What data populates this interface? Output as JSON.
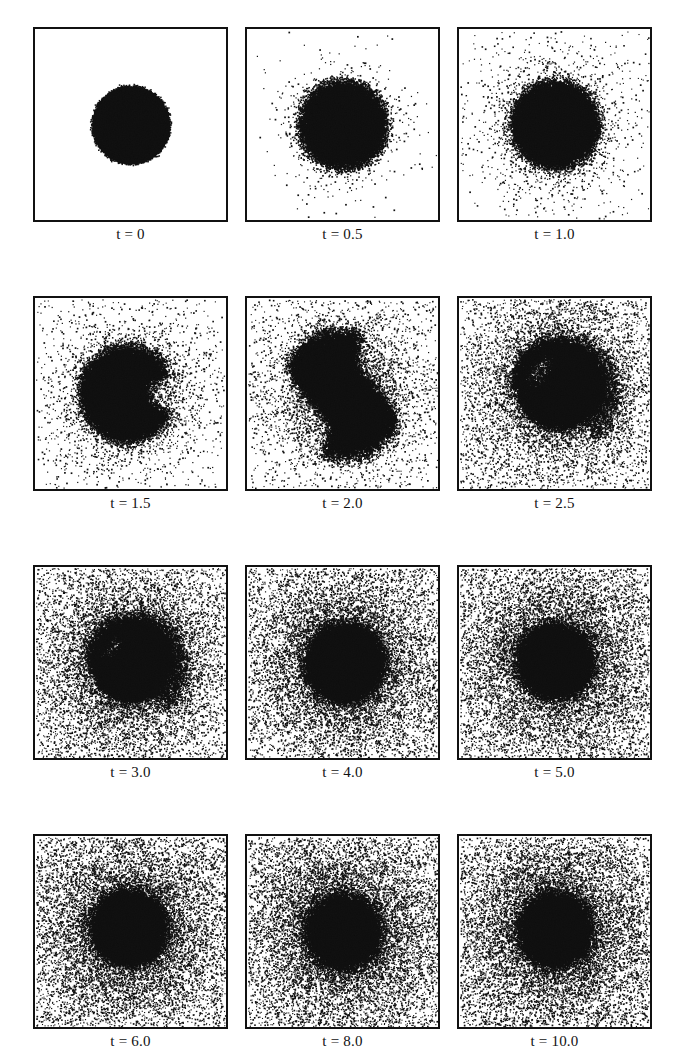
{
  "figure": {
    "kind": "particle-simulation-snapshot-grid",
    "rows": 4,
    "columns": 3,
    "panel_count": 12,
    "background_color": "#ffffff",
    "particle_color": "#111111",
    "frame_color": "#111111"
  },
  "chart_data": {
    "type": "scatter",
    "title": "",
    "xlabel": "",
    "ylabel": "",
    "grid": false,
    "legend": null,
    "xlim": [
      0,
      1
    ],
    "ylim": [
      0,
      1
    ],
    "time_variable": "t",
    "panels": [
      {
        "index": 0,
        "row": 0,
        "column": 0,
        "label": "t = 0",
        "time": 0,
        "core_radius": 0.205,
        "core_fill": 1.0,
        "halo_particles": 0,
        "halo_scale": 0.0,
        "background_particles": 0,
        "shape": "disk",
        "edge_softness": 0.012,
        "deform": 0.0,
        "twist": 0.0,
        "core_cx": 0.5,
        "core_cy": 0.5
      },
      {
        "index": 1,
        "row": 0,
        "column": 1,
        "label": "t = 0.5",
        "time": 0.5,
        "core_radius": 0.225,
        "core_fill": 1.0,
        "halo_particles": 5200,
        "halo_scale": 0.17,
        "background_particles": 0,
        "shape": "disk",
        "edge_softness": 0.055,
        "deform": 0.05,
        "twist": 0.0,
        "core_cx": 0.5,
        "core_cy": 0.5
      },
      {
        "index": 2,
        "row": 0,
        "column": 2,
        "label": "t = 1.0",
        "time": 1.0,
        "core_radius": 0.225,
        "core_fill": 1.0,
        "halo_particles": 6400,
        "halo_scale": 0.24,
        "background_particles": 400,
        "shape": "disk",
        "edge_softness": 0.05,
        "deform": 0.1,
        "twist": 0.25,
        "core_cx": 0.5,
        "core_cy": 0.5
      },
      {
        "index": 3,
        "row": 1,
        "column": 0,
        "label": "t = 1.5",
        "time": 1.5,
        "core_radius": 0.245,
        "core_fill": 1.0,
        "halo_particles": 7000,
        "halo_scale": 0.3,
        "background_particles": 900,
        "shape": "notched-disk",
        "edge_softness": 0.055,
        "deform": 0.16,
        "twist": 0.55,
        "core_cx": 0.48,
        "core_cy": 0.5
      },
      {
        "index": 4,
        "row": 1,
        "column": 1,
        "label": "t = 2.0",
        "time": 2.0,
        "core_radius": 0.33,
        "core_fill": 1.0,
        "halo_particles": 9000,
        "halo_scale": 0.34,
        "background_particles": 1800,
        "shape": "s-bar",
        "edge_softness": 0.05,
        "deform": 0.5,
        "twist": 1.15,
        "core_cx": 0.5,
        "core_cy": 0.5
      },
      {
        "index": 5,
        "row": 1,
        "column": 2,
        "label": "t = 2.5",
        "time": 2.5,
        "core_radius": 0.245,
        "core_fill": 1.0,
        "halo_particles": 11000,
        "halo_scale": 0.42,
        "background_particles": 5200,
        "shape": "comma-spiral",
        "edge_softness": 0.05,
        "deform": 0.38,
        "twist": 1.6,
        "core_cx": 0.52,
        "core_cy": 0.47
      },
      {
        "index": 6,
        "row": 2,
        "column": 0,
        "label": "t = 3.0",
        "time": 3.0,
        "core_radius": 0.225,
        "core_fill": 1.0,
        "halo_particles": 11500,
        "halo_scale": 0.46,
        "background_particles": 7200,
        "shape": "comma-spiral",
        "edge_softness": 0.055,
        "deform": 0.3,
        "twist": 2.0,
        "core_cx": 0.5,
        "core_cy": 0.5
      },
      {
        "index": 7,
        "row": 2,
        "column": 1,
        "label": "t = 4.0",
        "time": 4.0,
        "core_radius": 0.2,
        "core_fill": 1.0,
        "halo_particles": 11500,
        "halo_scale": 0.5,
        "background_particles": 8200,
        "shape": "blob",
        "edge_softness": 0.06,
        "deform": 0.14,
        "twist": 2.4,
        "core_cx": 0.51,
        "core_cy": 0.5
      },
      {
        "index": 8,
        "row": 2,
        "column": 2,
        "label": "t = 5.0",
        "time": 5.0,
        "core_radius": 0.185,
        "core_fill": 1.0,
        "halo_particles": 11500,
        "halo_scale": 0.52,
        "background_particles": 8800,
        "shape": "blob",
        "edge_softness": 0.065,
        "deform": 0.12,
        "twist": 2.8,
        "core_cx": 0.5,
        "core_cy": 0.49
      },
      {
        "index": 9,
        "row": 3,
        "column": 0,
        "label": "t = 6.0",
        "time": 6.0,
        "core_radius": 0.185,
        "core_fill": 1.0,
        "halo_particles": 11500,
        "halo_scale": 0.54,
        "background_particles": 9200,
        "shape": "blob",
        "edge_softness": 0.07,
        "deform": 0.12,
        "twist": 3.2,
        "core_cx": 0.49,
        "core_cy": 0.48
      },
      {
        "index": 10,
        "row": 3,
        "column": 1,
        "label": "t = 8.0",
        "time": 8.0,
        "core_radius": 0.175,
        "core_fill": 1.0,
        "halo_particles": 11500,
        "halo_scale": 0.56,
        "background_particles": 9600,
        "shape": "blob",
        "edge_softness": 0.075,
        "deform": 0.1,
        "twist": 3.8,
        "core_cx": 0.5,
        "core_cy": 0.5
      },
      {
        "index": 11,
        "row": 3,
        "column": 2,
        "label": "t = 10.0",
        "time": 10.0,
        "core_radius": 0.17,
        "core_fill": 1.0,
        "halo_particles": 11500,
        "halo_scale": 0.58,
        "background_particles": 9800,
        "shape": "blob",
        "edge_softness": 0.08,
        "deform": 0.1,
        "twist": 4.2,
        "core_cx": 0.5,
        "core_cy": 0.49
      }
    ]
  }
}
